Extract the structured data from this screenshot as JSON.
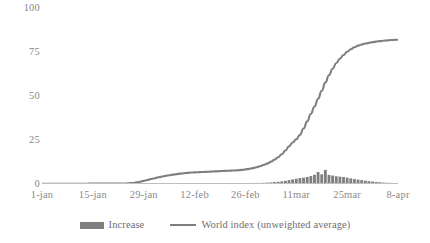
{
  "chart_data": {
    "type": "line",
    "title": "",
    "xlabel": "",
    "ylabel": "",
    "ylim": [
      0,
      100
    ],
    "yticks": [
      0,
      25,
      50,
      75,
      100
    ],
    "ytick_labels": [
      "0",
      "25",
      "50",
      "75",
      "100"
    ],
    "grid": false,
    "legend_position": "bottom",
    "xtick_labels": [
      "1-jan",
      "15-jan",
      "29-jan",
      "12-feb",
      "26-feb",
      "11mar",
      "25mar",
      "8-apr"
    ],
    "xtick_days": [
      0,
      14,
      28,
      42,
      56,
      70,
      84,
      98
    ],
    "x_days_range": [
      0,
      98
    ],
    "series": [
      {
        "name": "Increase",
        "type": "bar",
        "color": "#7f7f7f",
        "values": [
          0,
          0,
          0,
          0,
          0,
          0,
          0,
          0,
          0,
          0,
          0,
          0,
          0,
          0,
          0,
          0,
          0,
          0,
          0,
          0,
          0,
          0,
          0,
          0,
          0.1,
          0.1,
          0.1,
          0.2,
          0.2,
          0.2,
          0.2,
          0.2,
          0.3,
          0.3,
          0.3,
          0.3,
          0.3,
          0.3,
          0.3,
          0.3,
          0.3,
          0.3,
          0.3,
          0.3,
          0.3,
          0.3,
          0.3,
          0.3,
          0.3,
          0.3,
          0.3,
          0.3,
          0.3,
          0.3,
          0.4,
          0.4,
          0.4,
          0.5,
          0.5,
          0.6,
          0.6,
          0.7,
          0.8,
          0.9,
          1.1,
          1.3,
          1.5,
          1.8,
          2.2,
          2.6,
          3.0,
          3.4,
          3.6,
          4.0,
          4.5,
          5.2,
          6.8,
          5.5,
          8.0,
          5.2,
          4.8,
          4.4,
          4.2,
          4.0,
          3.6,
          3.2,
          2.8,
          2.5,
          2.2,
          1.9,
          1.6,
          1.4,
          1.2,
          1.0,
          0.8,
          0.7,
          0.6,
          0.5,
          0.4
        ]
      },
      {
        "name": "World index (unweighted average)",
        "type": "line",
        "color": "#7f7f7f",
        "values": [
          0.1,
          0.1,
          0.1,
          0.1,
          0.1,
          0.1,
          0.1,
          0.1,
          0.1,
          0.1,
          0.1,
          0.1,
          0.1,
          0.2,
          0.2,
          0.2,
          0.2,
          0.2,
          0.2,
          0.2,
          0.2,
          0.2,
          0.2,
          0.3,
          0.4,
          0.6,
          0.9,
          1.3,
          1.8,
          2.3,
          2.8,
          3.3,
          3.8,
          4.2,
          4.6,
          5.0,
          5.3,
          5.6,
          5.9,
          6.1,
          6.3,
          6.5,
          6.6,
          6.7,
          6.8,
          6.9,
          7.0,
          7.1,
          7.2,
          7.3,
          7.4,
          7.5,
          7.6,
          7.7,
          7.8,
          8.0,
          8.3,
          8.6,
          9.0,
          9.5,
          10.1,
          10.8,
          11.6,
          12.6,
          13.8,
          15.2,
          16.9,
          19.0,
          21.4,
          23.6,
          25.4,
          27.9,
          31.5,
          35.6,
          39.8,
          44.0,
          48.4,
          53.0,
          57.6,
          61.8,
          65.5,
          68.6,
          71.2,
          73.3,
          75.1,
          76.6,
          77.7,
          78.6,
          79.3,
          79.8,
          80.2,
          80.6,
          80.9,
          81.2,
          81.4,
          81.6,
          81.8,
          81.9,
          82.0
        ]
      }
    ]
  },
  "legend": {
    "items": [
      {
        "label": "Increase",
        "marker": "bar-swatch",
        "color": "#7f7f7f"
      },
      {
        "label": "World index (unweighted average)",
        "marker": "line-swatch",
        "color": "#7f7f7f"
      }
    ]
  },
  "colors": {
    "series": "#7f7f7f",
    "axis": "#bfbfbf",
    "tick_text": "#8a8a8a",
    "background": "#ffffff"
  }
}
